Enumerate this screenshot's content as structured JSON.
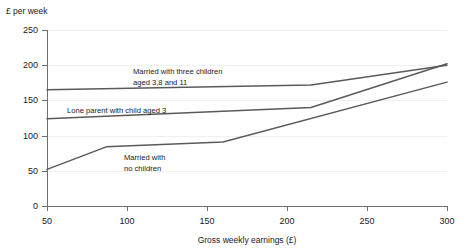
{
  "chart_data": {
    "type": "line",
    "title": "",
    "ylabel": "£ per week",
    "xlabel": "Gross weekly earnings (£)",
    "xlim": [
      50,
      300
    ],
    "ylim": [
      0,
      250
    ],
    "xticks": [
      50,
      100,
      150,
      200,
      250,
      300
    ],
    "yticks": [
      0,
      50,
      100,
      150,
      200,
      250
    ],
    "grid": "horizontal-faint",
    "legend": "inline-annotations",
    "series": [
      {
        "name": "Married with three children aged 3,8 and 11",
        "label_line_1": "Married with three children",
        "label_line_2": "aged 3,8 and 11",
        "x": [
          50,
          215,
          300
        ],
        "values": [
          165,
          172,
          200
        ]
      },
      {
        "name": "Lone parent with child aged 3",
        "label_line_1": "Lone parent with child aged 3",
        "label_line_2": "",
        "x": [
          50,
          215,
          300
        ],
        "values": [
          124,
          140,
          202
        ]
      },
      {
        "name": "Married with no children",
        "label_line_1": "Married  with",
        "label_line_2": "no children",
        "x": [
          50,
          87,
          160,
          300
        ],
        "values": [
          52,
          84,
          91,
          176
        ]
      }
    ]
  },
  "axes": {
    "y_axis_title": "£ per week",
    "x_axis_title": "Gross weekly earnings (£)",
    "y_tick_labels": [
      "250",
      "200",
      "150",
      "100",
      "50",
      "0"
    ],
    "x_tick_labels": [
      "50",
      "100",
      "150",
      "200",
      "250",
      "300"
    ]
  },
  "annotations": {
    "three_children_line1": "Married with three children",
    "three_children_line2": "aged 3,8 and 11",
    "lone_parent": "Lone parent with child aged 3",
    "no_children_line1": "Married  with",
    "no_children_line2": "no children"
  },
  "colors": {
    "line": "#5a5a5a",
    "axis": "#6e6e6e",
    "grid": "#f0f0f0",
    "text": "#1a1a1a",
    "background": "#ffffff"
  }
}
